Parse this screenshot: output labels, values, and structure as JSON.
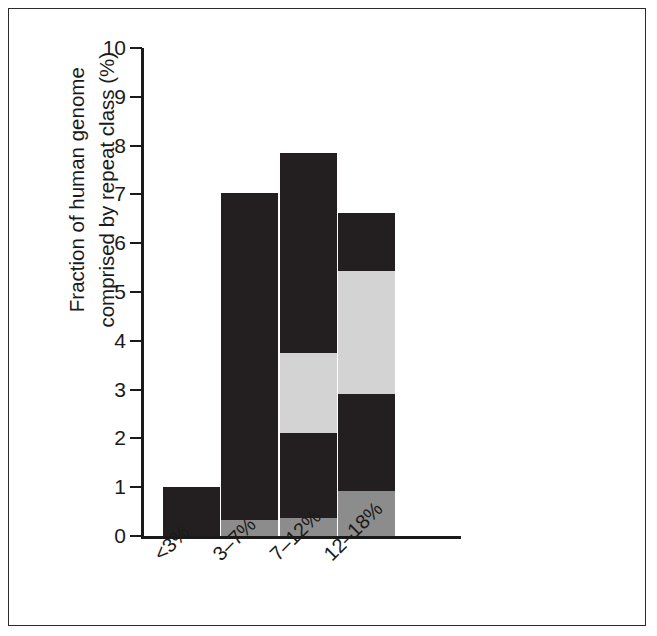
{
  "figure": {
    "frame_color": "#2b2b2b",
    "background": "#ffffff"
  },
  "chart_data": {
    "type": "bar",
    "stacked": true,
    "title": "",
    "xlabel": "",
    "ylabel_line1": "Fraction of human genome",
    "ylabel_line2": "comprised by repeat class (%)",
    "categories": [
      "<3%",
      "3–7%",
      "7–12%",
      "12–18%"
    ],
    "ylim": [
      0,
      10
    ],
    "yticks": [
      0,
      1,
      2,
      3,
      4,
      5,
      6,
      7,
      8,
      9,
      10
    ],
    "ytick_labels": [
      "0",
      "1",
      "2",
      "3",
      "4",
      "5",
      "6",
      "7",
      "8",
      "9",
      "10"
    ],
    "grid": false,
    "legend": "none",
    "series": [
      {
        "name": "segment-bottom",
        "color": "#8c8c8c",
        "values": [
          0.0,
          0.33,
          0.37,
          0.92
        ]
      },
      {
        "name": "segment-lower-dark",
        "color": "#231f20",
        "values": [
          1.0,
          6.7,
          1.74,
          2.0
        ]
      },
      {
        "name": "segment-light",
        "color": "#d3d3d3",
        "values": [
          0.0,
          0.0,
          1.63,
          2.51
        ]
      },
      {
        "name": "segment-upper-dark",
        "color": "#231f20",
        "values": [
          0.0,
          0.0,
          4.11,
          1.19
        ]
      }
    ],
    "bar_totals": [
      1.0,
      7.03,
      7.85,
      6.62
    ],
    "colors": {
      "dark": "#231f20",
      "light_gray": "#d3d3d3",
      "mid_gray": "#8c8c8c",
      "axis": "#1a1a1a"
    }
  }
}
